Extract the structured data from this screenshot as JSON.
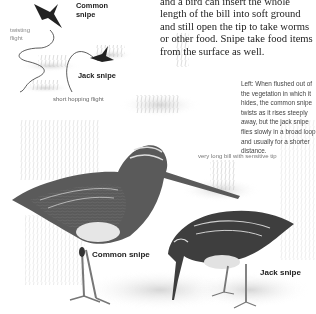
{
  "body_text": "and a bird can insert the whole length of the bill into soft ground and still open the tip to take worms or other food. Snipe take food items from the surface as well.",
  "caption": "Left: When flushed out of the vegetation in which it hides, the common snipe twists as it rises steeply away, but the jack snipe flies slowly in a broad loop and usually for a shorter distance.",
  "flight_diagram": {
    "common_snipe_label": "Common snipe",
    "twisting_flight_label": "twisting flight",
    "jack_snipe_label": "Jack snipe",
    "hopping_flight_label": "short hopping flight"
  },
  "illustration": {
    "bill_note": "very long bill with sensitive tip",
    "common_snipe_label": "Common snipe",
    "jack_snipe_label": "Jack snipe"
  }
}
